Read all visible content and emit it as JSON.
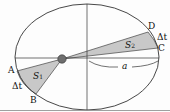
{
  "diagram": {
    "points": {
      "A": "A",
      "B": "B",
      "C": "C",
      "D": "D"
    },
    "areas": {
      "s1": {
        "main": "S",
        "sub": "1"
      },
      "s2": {
        "main": "S",
        "sub": "2"
      }
    },
    "time_labels": {
      "left": "Δt",
      "right": "Δt"
    },
    "semi_major_axis_label": "a",
    "colors": {
      "shade": "#c8c8c8",
      "sun": "#6e6e6e",
      "line": "#333333"
    }
  }
}
